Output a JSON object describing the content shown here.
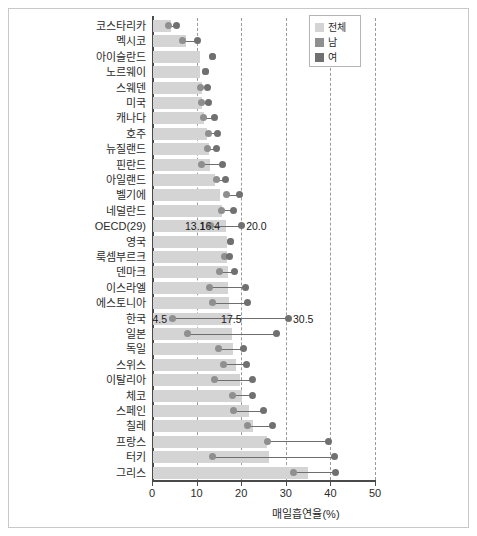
{
  "chart_data": {
    "type": "bar",
    "title": "",
    "xlabel": "매일흡연율(%)",
    "ylabel": "",
    "xlim": [
      0,
      50
    ],
    "xticks": [
      0,
      10,
      20,
      30,
      40,
      50
    ],
    "grid": "vertical-dashed",
    "legend_position": "top-right",
    "categories": [
      "코스타리카",
      "멕시코",
      "아이슬란드",
      "노르웨이",
      "스웨덴",
      "미국",
      "캐나다",
      "호주",
      "뉴질랜드",
      "핀란드",
      "아일랜드",
      "벨기에",
      "네덜란드",
      "OECD(29)",
      "영국",
      "룩셈부르크",
      "덴마크",
      "이스라엘",
      "에스토니아",
      "한국",
      "일본",
      "독일",
      "스위스",
      "이탈리아",
      "체코",
      "스페인",
      "칠레",
      "프랑스",
      "터키",
      "그리스"
    ],
    "series": [
      {
        "name": "전체",
        "key": "total",
        "color": "#d4d4d4",
        "values": [
          4.0,
          7.5,
          10.5,
          10.5,
          11.0,
          11.0,
          11.5,
          12.0,
          12.5,
          12.8,
          14.0,
          15.0,
          15.5,
          16.4,
          16.5,
          16.5,
          16.8,
          16.8,
          17.0,
          17.5,
          17.8,
          18.0,
          18.5,
          19.5,
          20.0,
          21.5,
          22.5,
          25.5,
          26.0,
          34.7
        ]
      },
      {
        "name": "남",
        "key": "male",
        "color": "#8f8f8f",
        "values": [
          3.6,
          6.8,
          13.5,
          12.0,
          10.8,
          11.0,
          11.6,
          12.6,
          12.4,
          11.0,
          14.5,
          16.8,
          15.6,
          13.1,
          17.5,
          16.2,
          15.2,
          13.0,
          13.5,
          4.5,
          8.0,
          15.0,
          16.0,
          14.0,
          18.0,
          18.2,
          21.5,
          26.0,
          13.5,
          31.8
        ]
      },
      {
        "name": "여",
        "key": "female",
        "color": "#707070",
        "values": [
          5.6,
          10.2,
          13.5,
          12.0,
          12.4,
          12.6,
          14.0,
          14.6,
          14.4,
          15.8,
          16.4,
          19.6,
          18.2,
          20.0,
          17.5,
          17.4,
          18.6,
          21.0,
          21.4,
          30.5,
          28.0,
          20.5,
          21.2,
          22.5,
          22.5,
          25.0,
          27.0,
          39.5,
          41.0,
          41.2
        ]
      }
    ],
    "annotations": [
      {
        "category": "OECD(29)",
        "value": "13.1",
        "series": "남",
        "align": "left"
      },
      {
        "category": "OECD(29)",
        "value": "16.4",
        "series": "전체",
        "align": "left"
      },
      {
        "category": "OECD(29)",
        "value": "20.0",
        "series": "여",
        "align": "right"
      },
      {
        "category": "한국",
        "value": "4.5",
        "series": "남",
        "align": "left"
      },
      {
        "category": "한국",
        "value": "17.5",
        "series": "전체",
        "align": "center"
      },
      {
        "category": "한국",
        "value": "30.5",
        "series": "여",
        "align": "right"
      }
    ]
  },
  "legend": {
    "items": [
      {
        "label": "전체",
        "color": "#d4d4d4"
      },
      {
        "label": "남",
        "color": "#8f8f8f"
      },
      {
        "label": "여",
        "color": "#707070"
      }
    ]
  },
  "axis": {
    "x_tick_labels": [
      "0",
      "10",
      "20",
      "30",
      "40",
      "50"
    ],
    "x_axis_title": "매일흡연율(%)"
  }
}
